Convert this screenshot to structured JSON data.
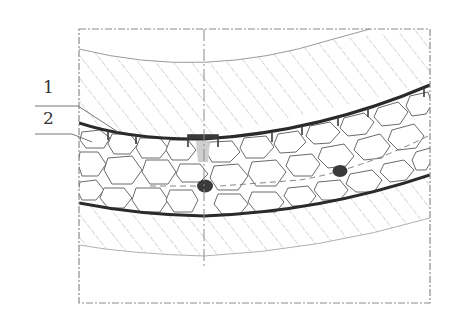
{
  "diagram": {
    "type": "technical-cross-section",
    "labels": [
      {
        "id": "1",
        "text": "1",
        "x": 43,
        "y": 93
      },
      {
        "id": "2",
        "text": "2",
        "x": 43,
        "y": 124
      }
    ],
    "colors": {
      "line_heavy": "#2a2a2a",
      "line_thin": "#8a8a8a",
      "hatch": "#a8a8a8",
      "stone_outline": "#6a6a6a",
      "blob": "#3a3a3a",
      "frame": "#8c8c8c"
    },
    "frame": {
      "x": 79,
      "y": 29,
      "width": 351,
      "height": 274
    },
    "centerline_x": 204,
    "markers": [
      {
        "name": "anchor-point-1",
        "cx": 205,
        "cy": 186
      },
      {
        "name": "anchor-point-2",
        "cx": 340,
        "cy": 171
      }
    ]
  }
}
